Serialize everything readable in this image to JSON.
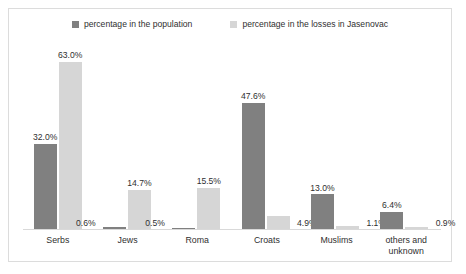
{
  "chart_data": {
    "type": "bar",
    "title": "",
    "subtitle": "",
    "xlabel": "",
    "ylabel": "",
    "ylim": [
      0,
      70
    ],
    "grid": false,
    "legend_position": "top-center",
    "categories": [
      "Serbs",
      "Jews",
      "Roma",
      "Croats",
      "Muslims",
      "others and unknown"
    ],
    "series": [
      {
        "name": "percentage in the population",
        "color": "#808080",
        "values": [
          32.0,
          0.6,
          0.5,
          47.6,
          13.0,
          6.4
        ],
        "labels": [
          "32.0%",
          "0.6%",
          "0.5%",
          "47.6%",
          "13.0%",
          "6.4%"
        ]
      },
      {
        "name": "percentage in the losses in Jasenovac",
        "color": "#d6d6d6",
        "values": [
          63.0,
          14.7,
          15.5,
          4.9,
          1.1,
          0.9
        ],
        "labels": [
          "63.0%",
          "14.7%",
          "15.5%",
          "4.9%",
          "1.1%",
          "0.9%"
        ]
      }
    ]
  },
  "legend": {
    "entries": [
      {
        "label": "percentage in the population",
        "swatch": "dark-gray-square"
      },
      {
        "label": "percentage in the losses in Jasenovac",
        "swatch": "light-gray-square"
      }
    ]
  },
  "axis": {
    "categories": [
      {
        "line1": "Serbs",
        "line2": ""
      },
      {
        "line1": "Jews",
        "line2": ""
      },
      {
        "line1": "Roma",
        "line2": ""
      },
      {
        "line1": "Croats",
        "line2": ""
      },
      {
        "line1": "Muslims",
        "line2": ""
      },
      {
        "line1": "others and",
        "line2": "unknown"
      }
    ]
  },
  "colors": {
    "series_population": "#808080",
    "series_losses": "#d6d6d6",
    "frame": "#dcdcdc",
    "baseline": "#d9d9d9",
    "text": "#2f2f2f",
    "background": "#ffffff"
  }
}
